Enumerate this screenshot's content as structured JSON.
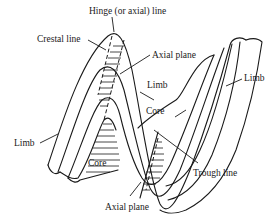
{
  "diagram": {
    "labels": {
      "hinge_line": "Hinge (or axial) line",
      "crestal_line": "Crestal line",
      "axial_plane_top": "Axial plane",
      "limb_center": "Limb",
      "limb_right": "Limb",
      "limb_left": "Limb",
      "core_upper": "Core",
      "core_lower": "Core",
      "trough_line": "Trough line",
      "axial_plane_bottom": "Axial plane"
    }
  }
}
